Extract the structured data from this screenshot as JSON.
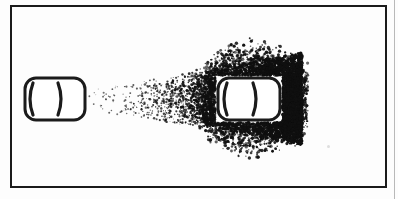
{
  "figure": {
    "background_color": "#fdfdfd",
    "ink_color": "#1b1b1b",
    "stipple_color": "#101010"
  },
  "frame": {
    "name": "figure-border",
    "x": 10,
    "y": 5,
    "width": 377,
    "height": 183,
    "stroke_width": 2,
    "color": "#1b1b1b"
  },
  "page_edge": {
    "name": "adjacent-panel-rule",
    "x": 394,
    "color": "#b9b9b9"
  },
  "objects": [
    {
      "name": "emitter-capsule",
      "role": "source",
      "x": 25,
      "y": 78,
      "width": 60,
      "height": 42,
      "corner_radius": 11,
      "stroke_width": 3,
      "color": "#1b1b1b",
      "fill": "#ffffff",
      "inner_arcs": [
        {
          "name": "left-arc",
          "glyph": "(",
          "cx": 33
        },
        {
          "name": "center-arc",
          "glyph": ")",
          "cx": 58
        }
      ]
    },
    {
      "name": "target-capsule",
      "role": "target",
      "x": 218,
      "y": 78,
      "width": 62,
      "height": 42,
      "corner_radius": 11,
      "stroke_width": 3,
      "color": "#1b1b1b",
      "fill": "#ffffff",
      "inner_arcs": [
        {
          "name": "left-arc",
          "glyph": "(",
          "cx": 227
        },
        {
          "name": "center-arc",
          "glyph": ")",
          "cx": 253
        }
      ]
    }
  ],
  "spray": {
    "name": "particle-cone",
    "origin_x": 86,
    "origin_y_top": 88,
    "origin_y_bottom": 112,
    "end_x": 302,
    "end_y_top": 52,
    "end_y_bottom": 146,
    "density_profile": "increasing left-to-right",
    "densest_region": {
      "x": 272,
      "y": 99,
      "label": "right of target capsule"
    },
    "particle_count": 4200,
    "color": "#101010"
  },
  "artifact": {
    "name": "scan-speck",
    "x": 327,
    "y": 145,
    "color": "#dedede"
  }
}
